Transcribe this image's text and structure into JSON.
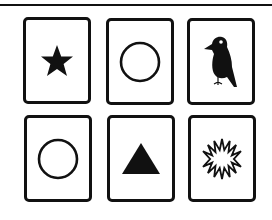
{
  "cards": [
    {
      "position": 1,
      "symbol": "star",
      "label": "Star",
      "icon": "star-icon",
      "fill": "#111111"
    },
    {
      "position": 2,
      "symbol": "circle",
      "label": "Circle",
      "icon": "circle-icon",
      "fill": "none"
    },
    {
      "position": 3,
      "symbol": "bird",
      "label": "Bird",
      "icon": "bird-icon",
      "fill": "#111111"
    },
    {
      "position": 4,
      "symbol": "circle",
      "label": "Circle",
      "icon": "circle-icon",
      "fill": "none"
    },
    {
      "position": 5,
      "symbol": "triangle",
      "label": "Triangle",
      "icon": "triangle-icon",
      "fill": "#111111"
    },
    {
      "position": 6,
      "symbol": "sunburst",
      "label": "Sunburst",
      "icon": "sunburst-icon",
      "fill": "none"
    }
  ],
  "colors": {
    "ink": "#111111",
    "background": "#ffffff"
  }
}
